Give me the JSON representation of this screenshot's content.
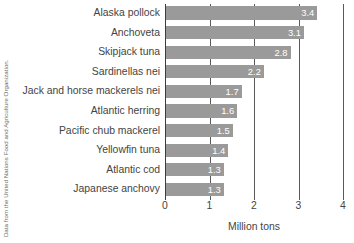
{
  "chart_data": {
    "type": "bar",
    "orientation": "horizontal",
    "title": "",
    "xlabel": "Million tons",
    "ylabel": "",
    "xlim": [
      0,
      4
    ],
    "xticks": [
      "0",
      "1",
      "2",
      "3",
      "4"
    ],
    "grid": true,
    "legend": false,
    "bar_color": "#9a9a9a",
    "categories": [
      "Alaska pollock",
      "Anchoveta",
      "Skipjack tuna",
      "Sardinellas nei",
      "Jack and horse mackerels nei",
      "Atlantic herring",
      "Pacific chub mackerel",
      "Yellowfin tuna",
      "Atlantic cod",
      "Japanese anchovy"
    ],
    "values": [
      3.4,
      3.1,
      2.8,
      2.2,
      1.7,
      1.6,
      1.5,
      1.4,
      1.3,
      1.3
    ],
    "value_labels": [
      "3.4",
      "3.1",
      "2.8",
      "2.2",
      "1.7",
      "1.6",
      "1.5",
      "1.4",
      "1.3",
      "1.3"
    ],
    "annotation": "Data from the United Nations Food and Agriculture Organization."
  }
}
